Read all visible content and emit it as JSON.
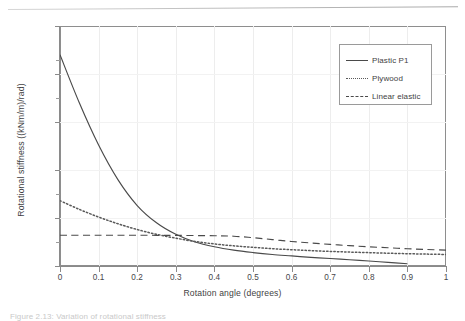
{
  "figure": {
    "caption": "Figure 2.13: Variation of rotational stiffness"
  },
  "chart_data": {
    "type": "line",
    "title": "",
    "xlabel": "Rotation angle (degrees)",
    "ylabel": "Rotational stiffness ((kNm/m)/rad)",
    "xlim": [
      0,
      1
    ],
    "ylim": [
      0,
      25000
    ],
    "xticks": [
      0,
      0.1,
      0.2,
      0.3,
      0.4,
      0.5,
      0.6,
      0.7,
      0.8,
      0.9,
      1
    ],
    "xticklabels": [
      "0",
      "0.1",
      "0.2",
      "0.3",
      "0.4",
      "0.5",
      "0.6",
      "0.7",
      "0.8",
      "0.9",
      "1"
    ],
    "yticks": [
      0,
      5000,
      10000,
      15000,
      20000,
      25000
    ],
    "yticklabels": [
      "0",
      "5000",
      "10000",
      "15000",
      "20000",
      "25000"
    ],
    "grid": "vertical-faint",
    "legend_position": "upper right",
    "series": [
      {
        "name": "Plastic P1",
        "style": "solid",
        "color": "#4a4a4a",
        "x": [
          0,
          0.05,
          0.1,
          0.15,
          0.2,
          0.25,
          0.3,
          0.35,
          0.4,
          0.45,
          0.5,
          0.55,
          0.6,
          0.65,
          0.7,
          0.75,
          0.8,
          0.85,
          0.9
        ],
        "y": [
          22000,
          17000,
          12600,
          9000,
          6300,
          4500,
          3300,
          2500,
          2000,
          1650,
          1400,
          1200,
          1050,
          900,
          780,
          650,
          520,
          380,
          230
        ]
      },
      {
        "name": "Plywood",
        "style": "dotted",
        "color": "#5a5a5a",
        "x": [
          0,
          0.05,
          0.1,
          0.15,
          0.2,
          0.25,
          0.3,
          0.35,
          0.4,
          0.45,
          0.5,
          0.55,
          0.6,
          0.65,
          0.7,
          0.75,
          0.8,
          0.85,
          0.9,
          0.95,
          1
        ],
        "y": [
          6800,
          5900,
          5100,
          4400,
          3800,
          3300,
          2900,
          2550,
          2300,
          2100,
          1950,
          1800,
          1700,
          1600,
          1520,
          1450,
          1390,
          1330,
          1280,
          1240,
          1200
        ]
      },
      {
        "name": "Linear elastic",
        "style": "dashed",
        "color": "#4a4a4a",
        "x": [
          0,
          0.1,
          0.2,
          0.3,
          0.4,
          0.45,
          0.5,
          0.55,
          0.6,
          0.65,
          0.7,
          0.75,
          0.8,
          0.85,
          0.9,
          0.95,
          1
        ],
        "y": [
          3200,
          3200,
          3200,
          3190,
          3150,
          3100,
          2950,
          2750,
          2550,
          2400,
          2250,
          2120,
          2000,
          1900,
          1800,
          1720,
          1650
        ]
      }
    ]
  }
}
